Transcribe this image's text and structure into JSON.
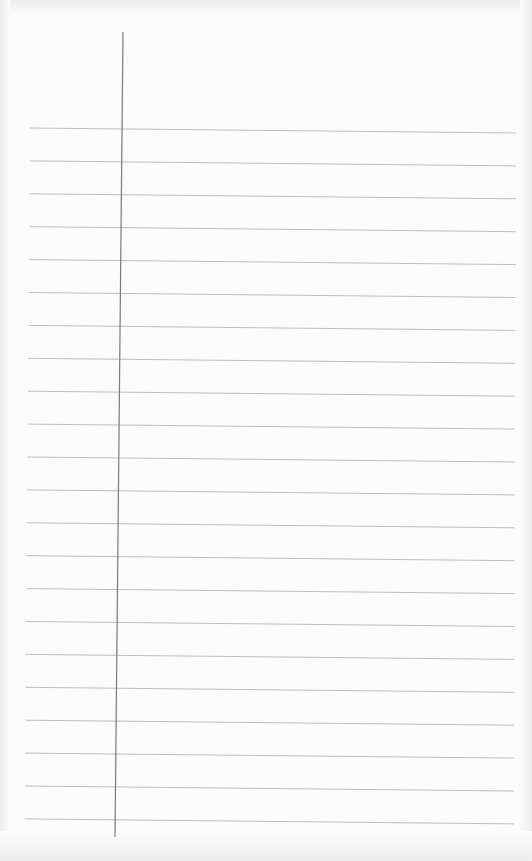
{
  "paper": {
    "type": "lined notebook paper",
    "background_color": "#fbfbfb",
    "rule_color": "#bdbdbd",
    "margin_color": "#7a7a7a",
    "rule_count": 22,
    "rule_start_y": 128,
    "rule_spacing": 32.9,
    "rule_left_x": 30,
    "rule_right_x": 516,
    "rule_slope_px": 5,
    "margin_top": [
      123,
      32
    ],
    "margin_bottom": [
      115,
      837
    ]
  }
}
